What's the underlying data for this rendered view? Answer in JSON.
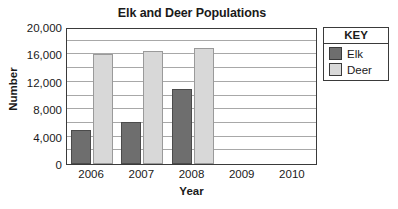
{
  "chart_data": {
    "type": "bar",
    "title": "Elk and Deer Populations",
    "xlabel": "Year",
    "ylabel": "Number",
    "categories": [
      "2006",
      "2007",
      "2008",
      "2009",
      "2010"
    ],
    "series": [
      {
        "name": "Elk",
        "color": "#6e6e6e",
        "values": [
          5000,
          6200,
          11000,
          null,
          null
        ]
      },
      {
        "name": "Deer",
        "color": "#d8d8d8",
        "values": [
          16000,
          16500,
          17000,
          null,
          null
        ]
      }
    ],
    "ylim": [
      0,
      20000
    ],
    "ytick_labels": [
      "0",
      "4,000",
      "8,000",
      "12,000",
      "16,000",
      "20,000"
    ],
    "ytick_values": [
      0,
      4000,
      8000,
      12000,
      16000,
      20000
    ],
    "gridline_step": 2000,
    "grid": true,
    "legend_position": "right",
    "legend_title": "KEY"
  }
}
